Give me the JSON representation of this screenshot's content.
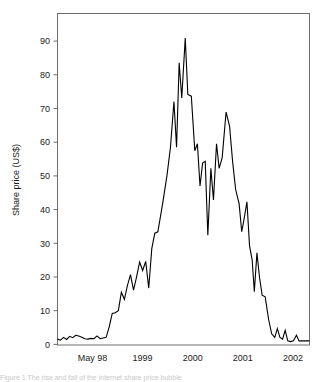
{
  "figure": {
    "background_color": "#ffffff",
    "frame_color": "#6e6e6e",
    "line_color": "#000000",
    "caption_fragment": "Figure 1  The rise and fall of the internet share price bubble"
  },
  "chart_data": {
    "type": "line",
    "title": "",
    "subtitle": "",
    "xlabel": "",
    "ylabel": "Share price (US$)",
    "grid": false,
    "legend": false,
    "legend_position": "none",
    "xlim": [
      0,
      58
    ],
    "ylim": [
      0,
      94
    ],
    "ytick_values": [
      0,
      10,
      20,
      30,
      40,
      50,
      60,
      70,
      80,
      90
    ],
    "ytick_labels": [
      "0",
      "10",
      "20",
      "30",
      "40",
      "50",
      "60",
      "70",
      "80",
      "90"
    ],
    "xtick_positions": [
      8,
      19.5,
      31,
      42.5,
      54
    ],
    "xtick_labels": [
      "May 98",
      "1999",
      "2000",
      "2001",
      "2002"
    ],
    "series": [
      {
        "name": "Share price",
        "x": [
          0,
          1,
          2,
          3,
          4,
          5,
          6,
          7,
          8,
          9,
          10,
          11,
          12,
          13,
          14,
          15,
          16,
          17,
          18,
          19,
          20,
          21,
          22,
          23,
          24,
          25,
          26,
          27,
          28,
          29,
          30,
          31,
          32,
          33,
          34,
          35,
          36,
          37,
          38,
          39,
          40,
          41,
          42,
          43,
          44,
          45,
          46,
          47,
          48,
          49,
          50,
          51,
          52,
          53,
          54,
          55,
          56,
          57,
          58
        ],
        "values": [
          1.5,
          1.2,
          2.0,
          1.4,
          2.3,
          1.9,
          2.5,
          2.4,
          2.0,
          1.9,
          1.5,
          1.6,
          1.8,
          1.6,
          2.3,
          1.6,
          1.8,
          5.0,
          9.0,
          9.2,
          10.0,
          14.5,
          13.0,
          16.5,
          19.5,
          15.5,
          19.0,
          23.0,
          21.0,
          23.5,
          16.0,
          27.0,
          31.5,
          32.0,
          40.0,
          48.0,
          56.0,
          69.0,
          56.0,
          80.0,
          70.0,
          87.0,
          71.0,
          70.5,
          55.0,
          57.0,
          45.0,
          51.5,
          52.0,
          31.0,
          50.0,
          41.0,
          57.0,
          50.0,
          53.0,
          66.0,
          62.0,
          56.0,
          46.0
        ],
        "note": "primary-segment-1998-to-mid-2000"
      }
    ],
    "points": [
      {
        "x": 0,
        "y": 1.5
      },
      {
        "x": 0.7,
        "y": 1.2
      },
      {
        "x": 1.4,
        "y": 2.0
      },
      {
        "x": 2.1,
        "y": 1.4
      },
      {
        "x": 2.8,
        "y": 2.3
      },
      {
        "x": 3.5,
        "y": 1.9
      },
      {
        "x": 4.2,
        "y": 2.6
      },
      {
        "x": 4.9,
        "y": 2.4
      },
      {
        "x": 5.6,
        "y": 2.0
      },
      {
        "x": 6.3,
        "y": 1.6
      },
      {
        "x": 7.0,
        "y": 1.5
      },
      {
        "x": 7.7,
        "y": 1.7
      },
      {
        "x": 8.4,
        "y": 1.6
      },
      {
        "x": 9.1,
        "y": 2.4
      },
      {
        "x": 9.8,
        "y": 1.6
      },
      {
        "x": 10.5,
        "y": 1.8
      },
      {
        "x": 11.2,
        "y": 2.0
      },
      {
        "x": 11.9,
        "y": 5.0
      },
      {
        "x": 12.6,
        "y": 8.8
      },
      {
        "x": 13.3,
        "y": 9.0
      },
      {
        "x": 14.0,
        "y": 9.6
      },
      {
        "x": 14.7,
        "y": 14.8
      },
      {
        "x": 15.4,
        "y": 12.8
      },
      {
        "x": 16.1,
        "y": 16.8
      },
      {
        "x": 16.8,
        "y": 19.8
      },
      {
        "x": 17.5,
        "y": 15.4
      },
      {
        "x": 18.2,
        "y": 19.2
      },
      {
        "x": 18.9,
        "y": 23.4
      },
      {
        "x": 19.6,
        "y": 21.0
      },
      {
        "x": 20.3,
        "y": 23.6
      },
      {
        "x": 21.0,
        "y": 16.0
      },
      {
        "x": 21.7,
        "y": 27.2
      },
      {
        "x": 22.4,
        "y": 31.6
      },
      {
        "x": 23.1,
        "y": 32.0
      },
      {
        "x": 24.2,
        "y": 40.0
      },
      {
        "x": 25.2,
        "y": 48.0
      },
      {
        "x": 26.0,
        "y": 56.0
      },
      {
        "x": 26.8,
        "y": 69.0
      },
      {
        "x": 27.4,
        "y": 56.0
      },
      {
        "x": 28.0,
        "y": 80.0
      },
      {
        "x": 28.6,
        "y": 70.0
      },
      {
        "x": 29.4,
        "y": 87.0
      },
      {
        "x": 30.0,
        "y": 71.0
      },
      {
        "x": 30.8,
        "y": 70.5
      },
      {
        "x": 31.6,
        "y": 55.0
      },
      {
        "x": 32.2,
        "y": 57.0
      },
      {
        "x": 32.8,
        "y": 45.0
      },
      {
        "x": 33.4,
        "y": 51.5
      },
      {
        "x": 34.0,
        "y": 52.0
      },
      {
        "x": 34.6,
        "y": 31.0
      },
      {
        "x": 35.3,
        "y": 50.0
      },
      {
        "x": 35.9,
        "y": 41.0
      },
      {
        "x": 36.6,
        "y": 57.0
      },
      {
        "x": 37.2,
        "y": 50.0
      },
      {
        "x": 37.9,
        "y": 53.0
      },
      {
        "x": 38.8,
        "y": 66.0
      },
      {
        "x": 39.6,
        "y": 62.0
      },
      {
        "x": 40.3,
        "y": 52.0
      },
      {
        "x": 41.0,
        "y": 44.0
      },
      {
        "x": 41.8,
        "y": 40.0
      },
      {
        "x": 42.4,
        "y": 32.0
      },
      {
        "x": 43.0,
        "y": 36.0
      },
      {
        "x": 43.6,
        "y": 40.5
      },
      {
        "x": 44.2,
        "y": 28.0
      },
      {
        "x": 44.8,
        "y": 24.0
      },
      {
        "x": 45.3,
        "y": 15.0
      },
      {
        "x": 45.9,
        "y": 26.0
      },
      {
        "x": 46.5,
        "y": 19.0
      },
      {
        "x": 47.1,
        "y": 14.0
      },
      {
        "x": 47.8,
        "y": 13.5
      },
      {
        "x": 48.6,
        "y": 7.0
      },
      {
        "x": 49.3,
        "y": 3.0
      },
      {
        "x": 50.0,
        "y": 2.0
      },
      {
        "x": 50.6,
        "y": 4.5
      },
      {
        "x": 51.2,
        "y": 2.0
      },
      {
        "x": 51.8,
        "y": 1.5
      },
      {
        "x": 52.4,
        "y": 4.0
      },
      {
        "x": 53.0,
        "y": 1.0
      },
      {
        "x": 53.6,
        "y": 0.8
      },
      {
        "x": 54.3,
        "y": 1.0
      },
      {
        "x": 55.0,
        "y": 2.6
      },
      {
        "x": 55.6,
        "y": 1.0
      },
      {
        "x": 56.4,
        "y": 1.0
      },
      {
        "x": 57.2,
        "y": 1.0
      },
      {
        "x": 58.0,
        "y": 1.0
      }
    ],
    "peaks": [
      {
        "label": "first peak",
        "x_approx": "late 1999",
        "value": 87
      },
      {
        "label": "secondary spike",
        "x_approx": "late 1999",
        "value": 80
      },
      {
        "label": "trough",
        "x_approx": "early 2000",
        "value": 31
      },
      {
        "label": "second peak",
        "x_approx": "mid 2000",
        "value": 66
      },
      {
        "label": "final level",
        "x_approx": "2002",
        "value": 1
      }
    ]
  }
}
